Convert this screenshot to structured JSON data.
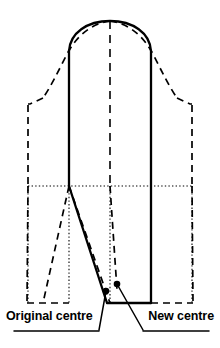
{
  "figure": {
    "name": "pattern-block-diagram",
    "kind": "sewing-pattern-sleeve-block",
    "background_color": "#ffffff",
    "ink_color": "#000000"
  },
  "labels": {
    "original_centre": "Original centre",
    "new_centre": "New centre"
  },
  "legend": {
    "solid_line_meaning": "New pattern outline",
    "dashed_line_meaning": "Original pattern outline",
    "dotted_line_meaning": "Construction / centre guide lines"
  },
  "markers": [
    {
      "id": "original-centre-dot",
      "label": "Original centre",
      "x": 106,
      "y": 291
    },
    {
      "id": "new-centre-dot",
      "label": "New centre",
      "x": 117,
      "y": 284
    }
  ],
  "geometry": {
    "solid_outline": {
      "description": "New re-centred block: domed cap, straight side seams, tapered lower left edge to hem",
      "cap_apex_x": 110,
      "cap_apex_y": 21,
      "left_side_x": 69,
      "right_side_x": 151,
      "shoulder_y": 50,
      "hem_y": 303
    },
    "dashed_outline": {
      "description": "Original block: wider sloping shoulders, straight outer side seams, flared hem",
      "left_outer_x": 28,
      "right_outer_x": 192,
      "shoulder_step_y": 105,
      "hem_y": 303
    },
    "guides": {
      "vertical_centre_dash_x": 110,
      "horizontal_dotted_y": 186,
      "horizontal_dotted_x1": 28,
      "horizontal_dotted_x2": 192,
      "dotted_verticals_x": [
        69,
        110,
        192,
        28
      ]
    }
  },
  "colors": {
    "line": "#000000",
    "guide": "#555555",
    "page": "#ffffff"
  }
}
